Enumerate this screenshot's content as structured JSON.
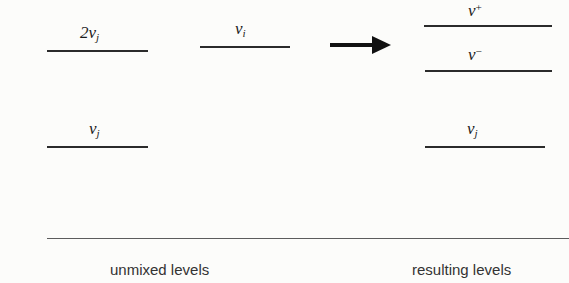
{
  "diagram": {
    "type": "energy-level-diagram",
    "background_color": "#fcfcfa",
    "line_color": "#2b2b2b"
  },
  "unmixed": {
    "caption": "unmixed levels",
    "levels": [
      {
        "id": "overtone",
        "label_prefix": "2",
        "label_symbol": "ν",
        "label_sub": "j",
        "label_text": "2νj",
        "line_x": 47,
        "line_width": 101,
        "line_y": 50,
        "label_x": 80,
        "label_y": 24
      },
      {
        "id": "fundamental-i",
        "label_prefix": "",
        "label_symbol": "ν",
        "label_sub": "i",
        "label_text": "νi",
        "line_x": 200,
        "line_width": 90,
        "line_y": 46,
        "label_x": 235,
        "label_y": 20
      },
      {
        "id": "fundamental-j",
        "label_prefix": "",
        "label_symbol": "ν",
        "label_sub": "j",
        "label_text": "νj",
        "line_x": 47,
        "line_width": 101,
        "line_y": 146,
        "label_x": 89,
        "label_y": 120
      }
    ]
  },
  "resulting": {
    "caption": "resulting levels",
    "levels": [
      {
        "id": "nu-plus",
        "label_symbol": "ν",
        "label_sup": "+",
        "label_text": "ν+",
        "line_x": 424,
        "line_width": 128,
        "line_y": 25,
        "label_x": 468,
        "label_y": 2
      },
      {
        "id": "nu-minus",
        "label_symbol": "ν",
        "label_sup": "−",
        "label_text": "ν−",
        "line_x": 425,
        "line_width": 127,
        "line_y": 70,
        "label_x": 468,
        "label_y": 46
      },
      {
        "id": "fundamental-j-result",
        "label_symbol": "ν",
        "label_sub": "j",
        "label_text": "νj",
        "line_x": 425,
        "line_width": 120,
        "line_y": 146,
        "label_x": 467,
        "label_y": 120
      }
    ]
  },
  "arrow": {
    "icon": "arrow-right-icon",
    "direction": "right"
  }
}
